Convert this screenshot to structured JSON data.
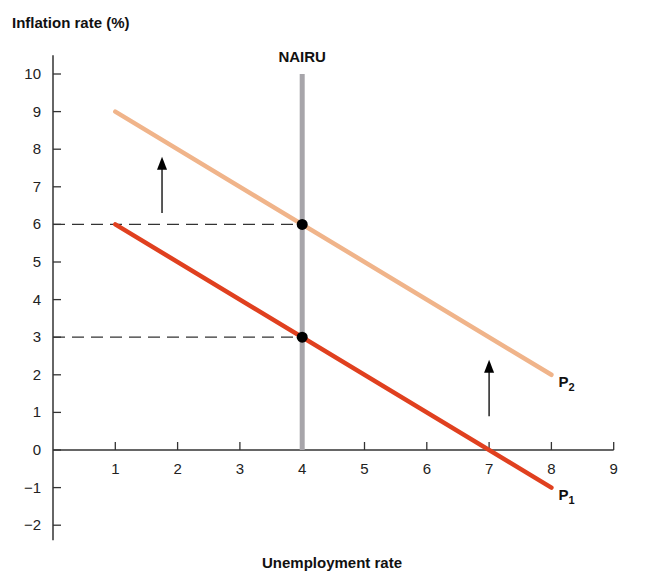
{
  "chart_data": {
    "type": "line",
    "title": "",
    "ylabel": "Inflation rate (%)",
    "xlabel": "Unemployment rate",
    "xlim": [
      0,
      9
    ],
    "ylim": [
      -2,
      10
    ],
    "x_ticks": [
      1,
      2,
      3,
      4,
      5,
      6,
      7,
      8,
      9
    ],
    "y_ticks": [
      -2,
      -1,
      0,
      1,
      2,
      3,
      4,
      5,
      6,
      7,
      8,
      9,
      10
    ],
    "y_tick_labels": [
      "−2",
      "−1",
      "0",
      "1",
      "2",
      "3",
      "4",
      "5",
      "6",
      "7",
      "8",
      "9",
      "10"
    ],
    "grid": false,
    "series": [
      {
        "name": "P1",
        "label_main": "P",
        "label_sub": "1",
        "color": "#e0401f",
        "points": [
          [
            1,
            6
          ],
          [
            8,
            -1
          ]
        ]
      },
      {
        "name": "P2",
        "label_main": "P",
        "label_sub": "2",
        "color": "#f0b48a",
        "points": [
          [
            1,
            9
          ],
          [
            8,
            2
          ]
        ]
      }
    ],
    "vertical_lines": [
      {
        "name": "NAIRU",
        "label": "NAIRU",
        "x": 4,
        "y_range": [
          0,
          10
        ],
        "color": "#a7a5aa"
      }
    ],
    "reference_lines": [
      {
        "type": "dashed-horizontal",
        "y": 6,
        "x_range": [
          0,
          4
        ]
      },
      {
        "type": "dashed-horizontal",
        "y": 3,
        "x_range": [
          0,
          4
        ]
      }
    ],
    "points": [
      {
        "x": 4,
        "y": 6,
        "series": "P2"
      },
      {
        "x": 4,
        "y": 3,
        "series": "P1"
      }
    ],
    "annotations": [
      {
        "type": "arrow-up",
        "x": 1.75,
        "from_y": 6.3,
        "to_y": 7.8
      },
      {
        "type": "arrow-up",
        "x": 7,
        "from_y": 0.9,
        "to_y": 2.4
      }
    ]
  }
}
